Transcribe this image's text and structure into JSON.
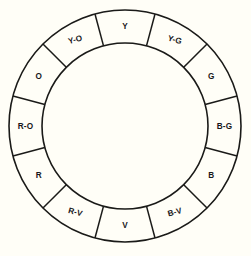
{
  "diagram": {
    "type": "ring-segment-wheel",
    "segment_count": 12,
    "geometry": {
      "center_x": 125,
      "center_y": 126,
      "outer_radius": 116,
      "inner_radius": 83,
      "label_radius": 99.5,
      "start_angle_deg": -105
    },
    "colors": {
      "background": "#fffef7",
      "stroke": "#1a1a18",
      "segment_fill": "#fffef7",
      "label_text": "#17171a"
    },
    "segments": [
      {
        "label": "Y",
        "name": "yellow",
        "center_angle_deg": -90,
        "label_rotation_deg": 0
      },
      {
        "label": "Y-G",
        "name": "yellow-green",
        "center_angle_deg": -60,
        "label_rotation_deg": 15
      },
      {
        "label": "G",
        "name": "green",
        "center_angle_deg": -30,
        "label_rotation_deg": 0
      },
      {
        "label": "B-G",
        "name": "blue-green",
        "center_angle_deg": 0,
        "label_rotation_deg": 0
      },
      {
        "label": "B",
        "name": "blue",
        "center_angle_deg": 30,
        "label_rotation_deg": 0
      },
      {
        "label": "B-V",
        "name": "blue-violet",
        "center_angle_deg": 60,
        "label_rotation_deg": -15
      },
      {
        "label": "V",
        "name": "violet",
        "center_angle_deg": 90,
        "label_rotation_deg": 0
      },
      {
        "label": "R-V",
        "name": "red-violet",
        "center_angle_deg": 120,
        "label_rotation_deg": 15
      },
      {
        "label": "R",
        "name": "red",
        "center_angle_deg": 150,
        "label_rotation_deg": 0
      },
      {
        "label": "R-O",
        "name": "red-orange",
        "center_angle_deg": 180,
        "label_rotation_deg": 0
      },
      {
        "label": "O",
        "name": "orange",
        "center_angle_deg": 210,
        "label_rotation_deg": 0
      },
      {
        "label": "Y-O",
        "name": "yellow-orange",
        "center_angle_deg": 240,
        "label_rotation_deg": -15
      }
    ]
  }
}
